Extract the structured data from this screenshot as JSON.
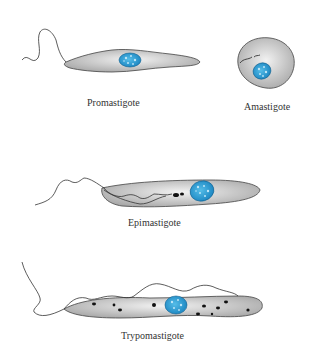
{
  "diagram": {
    "colors": {
      "body_fill": "#c8c8c8",
      "body_stroke": "#444444",
      "nucleus_fill": "#2a9fd6",
      "nucleus_spots": "#bfe6f7",
      "kinetoplast": "#111111"
    },
    "forms": [
      {
        "id": "promastigote",
        "label": "Promastigote"
      },
      {
        "id": "amastigote",
        "label": "Amastigote"
      },
      {
        "id": "epimastigote",
        "label": "Epimastigote"
      },
      {
        "id": "trypomastigote",
        "label": "Trypomastigote"
      }
    ]
  }
}
